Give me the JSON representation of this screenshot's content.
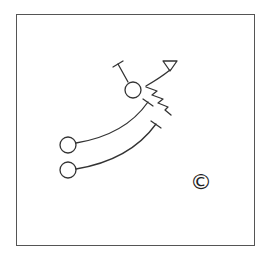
{
  "diagram": {
    "type": "play-diagram",
    "stroke_color": "#333333",
    "background": "#ffffff",
    "nodes": [
      {
        "id": "player-top",
        "shape": "circle",
        "cx": 133,
        "cy": 90,
        "r": 8
      },
      {
        "id": "player-left-upper",
        "shape": "circle",
        "cx": 68,
        "cy": 145,
        "r": 8
      },
      {
        "id": "player-left-lower",
        "shape": "circle",
        "cx": 68,
        "cy": 170,
        "r": 8
      },
      {
        "id": "target-triangle",
        "shape": "triangle",
        "points": [
          [
            163,
            61
          ],
          [
            177,
            61
          ],
          [
            170,
            71
          ]
        ]
      }
    ],
    "paths": [
      {
        "id": "block-line-top",
        "from": "player-top",
        "end": "T-cap"
      },
      {
        "id": "route-arc-to-triangle",
        "from": "player-top",
        "to": "target-triangle",
        "end": "arrow-triangle"
      },
      {
        "id": "motion-zigzag",
        "from": "player-top",
        "end": "none",
        "style": "zigzag"
      },
      {
        "id": "block-arc-upper",
        "from": "player-left-upper",
        "end": "T-cap"
      },
      {
        "id": "block-arc-lower",
        "from": "player-left-lower",
        "end": "T-cap"
      }
    ],
    "copyright_symbol": "©"
  }
}
